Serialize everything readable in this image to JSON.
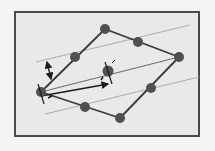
{
  "diagram": {
    "type": "crystal-lattice-rhombus",
    "frame": {
      "x": 14,
      "y": 11,
      "width": 186,
      "height": 126,
      "border_color": "#4a4a4a",
      "fill": "#e9e9e9"
    },
    "colors": {
      "atom": "#505050",
      "bond": "#3a3a3a",
      "plane_line": "#b0b0b0",
      "arrow": "#1a1a1a"
    },
    "atoms": [
      {
        "id": "left-vertex",
        "x": 41,
        "y": 92,
        "r": 5
      },
      {
        "id": "top-vertex",
        "x": 105,
        "y": 29,
        "r": 5
      },
      {
        "id": "right-vertex",
        "x": 179,
        "y": 57,
        "r": 5
      },
      {
        "id": "bottom-vertex",
        "x": 120,
        "y": 118,
        "r": 5
      },
      {
        "id": "mid-top-left",
        "x": 75,
        "y": 57,
        "r": 5
      },
      {
        "id": "mid-top-right",
        "x": 138,
        "y": 42,
        "r": 5
      },
      {
        "id": "mid-bottom-right",
        "x": 151,
        "y": 88,
        "r": 5
      },
      {
        "id": "mid-bottom-left",
        "x": 85,
        "y": 107,
        "r": 5
      },
      {
        "id": "center",
        "x": 108,
        "y": 71,
        "r": 5.5
      }
    ],
    "bonds": [
      [
        "left-vertex",
        "top-vertex"
      ],
      [
        "top-vertex",
        "right-vertex"
      ],
      [
        "right-vertex",
        "bottom-vertex"
      ],
      [
        "bottom-vertex",
        "left-vertex"
      ]
    ],
    "plane_lines": [
      {
        "x1": 36,
        "y1": 62,
        "x2": 190,
        "y2": 25
      },
      {
        "x1": 45,
        "y1": 114,
        "x2": 199,
        "y2": 77
      }
    ],
    "inner_line": {
      "x1": 41,
      "y1": 92,
      "x2": 179,
      "y2": 57
    },
    "vectors": [
      {
        "name": "lattice-vector",
        "x1": 41,
        "y1": 96,
        "x2": 108,
        "y2": 84
      },
      {
        "name": "plane-spacing",
        "x1": 47,
        "y1": 62,
        "x2": 51,
        "y2": 79
      }
    ]
  }
}
